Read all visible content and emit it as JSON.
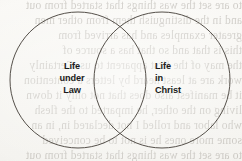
{
  "page": {
    "width": 242,
    "height": 161,
    "paper_color": "#f8f7f4",
    "ink_color": "#1b1b1b",
    "stroke_color": "#55504a"
  },
  "diagram": {
    "type": "venn-two-circle",
    "left_circle": {
      "cx": 78,
      "cy": 80,
      "r": 68
    },
    "right_circle": {
      "cx": 162,
      "cy": 80,
      "r": 68
    },
    "stroke_width": 1
  },
  "labels": {
    "left": {
      "name": "life-under-law",
      "lines": [
        "Life",
        "under",
        "Law"
      ]
    },
    "right": {
      "name": "life-in-christ",
      "lines": [
        "Life",
        "in",
        "Christ"
      ]
    }
  },
  "background_showthrough": {
    "description": "faint mirrored text bleeding through from the reverse side of the printed page",
    "lines": [
      "to are set the was things that started from out",
      "and in the distinguish them from other men",
      "greater examples and has arrived from",
      "this is that and so that has a source of",
      "the may of the first apparent to us. Certainly",
      "work are at least heard by letters a contention",
      "it be manifest also does that not only it down",
      "living on the other, he imparted to the flesh",
      "who labor and rolled I not declared in, in an",
      "some more ones he is not to be conceived"
    ]
  }
}
